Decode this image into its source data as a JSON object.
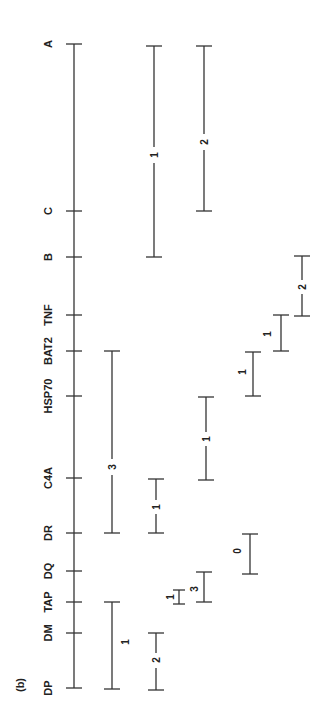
{
  "figure": {
    "panel_label": "(b)",
    "orientation": "rotated 90 degrees counter-clockwise",
    "loci": [
      {
        "name": "A",
        "y": 44
      },
      {
        "name": "C",
        "y": 211
      },
      {
        "name": "B",
        "y": 257
      },
      {
        "name": "TNF",
        "y": 315
      },
      {
        "name": "BAT2",
        "y": 351
      },
      {
        "name": "HSP70",
        "y": 396
      },
      {
        "name": "C4A",
        "y": 478
      },
      {
        "name": "DR",
        "y": 533
      },
      {
        "name": "DQ",
        "y": 571
      },
      {
        "name": "TAP",
        "y": 602
      },
      {
        "name": "DM",
        "y": 633
      },
      {
        "name": "DP",
        "y": 688
      }
    ],
    "intervals": [
      {
        "from": "A",
        "to": "B",
        "label": "1",
        "x": 154
      },
      {
        "from": "A",
        "to": "C",
        "label": "2",
        "x": 204
      },
      {
        "from": "BAT2",
        "to": "DR",
        "label": "3",
        "x": 112
      },
      {
        "from": "DR",
        "to": "C4A",
        "label": "1",
        "x": 156
      },
      {
        "from": "C4A",
        "to": "HSP70",
        "label": "1",
        "x": 206
      },
      {
        "from": "HSP70",
        "to": "BAT2",
        "label": "1",
        "x": 253
      },
      {
        "from": "BAT2",
        "to": "TNF",
        "label": "1",
        "x": 281
      },
      {
        "from": "TNF",
        "to": "B",
        "label": "2",
        "x": 302
      },
      {
        "from": "DR",
        "to": "DQ",
        "label": "0",
        "x": 250
      },
      {
        "from": "DQ",
        "to": "TAP",
        "label": "3",
        "x": 204
      },
      {
        "from": "TAP",
        "to": "TAP*",
        "label": "1",
        "x": 179
      },
      {
        "from": "TAP",
        "to": "DP",
        "label": "1",
        "x": 112
      },
      {
        "from": "DM",
        "to": "DP",
        "label": "2",
        "x": 156
      }
    ]
  }
}
